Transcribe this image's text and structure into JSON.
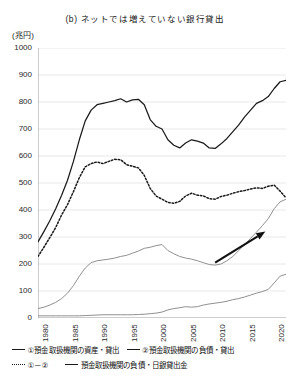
{
  "chart": {
    "title": "(b) ネットでは増えていない銀行貸出",
    "y_unit": "(兆円)"
  },
  "chart_data": {
    "type": "line",
    "title": "(b) ネットでは増えていない銀行貸出",
    "xlabel": "",
    "ylabel": "(兆円)",
    "xlim": [
      1980,
      2022
    ],
    "ylim": [
      0,
      1000
    ],
    "ytick_values": [
      0,
      100,
      200,
      300,
      400,
      500,
      600,
      700,
      800,
      900,
      1000
    ],
    "ytick_labels": [
      "0",
      "100",
      "200",
      "300",
      "400",
      "500",
      "600",
      "700",
      "800",
      "900",
      "1000"
    ],
    "xtick_values": [
      1980,
      1985,
      1990,
      1995,
      2000,
      2005,
      2010,
      2015,
      2020
    ],
    "xtick_labels": [
      "1980",
      "1985",
      "1990",
      "1995",
      "2000",
      "2005",
      "2010",
      "2015",
      "2020"
    ],
    "grid": "horizontal",
    "legend_position": "below",
    "x": [
      1980,
      1981,
      1982,
      1983,
      1984,
      1985,
      1986,
      1987,
      1988,
      1989,
      1990,
      1991,
      1992,
      1993,
      1994,
      1995,
      1996,
      1997,
      1998,
      1999,
      2000,
      2001,
      2002,
      2003,
      2004,
      2005,
      2006,
      2007,
      2008,
      2009,
      2010,
      2011,
      2012,
      2013,
      2014,
      2015,
      2016,
      2017,
      2018,
      2019,
      2020,
      2021,
      2022
    ],
    "series": [
      {
        "name": "①預金取扱機関の資産・貸出",
        "style": "solid",
        "color": "#1a1a1a",
        "values": [
          282,
          320,
          360,
          405,
          455,
          510,
          580,
          660,
          730,
          770,
          790,
          795,
          800,
          805,
          812,
          800,
          808,
          810,
          790,
          735,
          710,
          700,
          660,
          640,
          630,
          648,
          660,
          655,
          648,
          630,
          628,
          645,
          665,
          690,
          715,
          745,
          770,
          795,
          805,
          820,
          850,
          875,
          880
        ]
      },
      {
        "name": "②預金取扱機関の負債・貸出",
        "style": "solid-grey",
        "color": "#8a8a8a",
        "values": [
          35,
          40,
          48,
          58,
          72,
          92,
          120,
          155,
          185,
          205,
          212,
          215,
          218,
          222,
          228,
          232,
          240,
          248,
          258,
          262,
          268,
          272,
          250,
          238,
          228,
          222,
          218,
          212,
          205,
          198,
          196,
          200,
          212,
          228,
          250,
          272,
          295,
          318,
          342,
          368,
          405,
          430,
          440
        ]
      },
      {
        "name": "①－②",
        "style": "dotted",
        "color": "#1a1a1a",
        "values": [
          228,
          262,
          298,
          335,
          382,
          420,
          468,
          520,
          560,
          572,
          578,
          572,
          580,
          588,
          586,
          568,
          562,
          556,
          528,
          480,
          452,
          440,
          428,
          425,
          432,
          452,
          462,
          455,
          452,
          442,
          440,
          450,
          455,
          462,
          468,
          472,
          478,
          482,
          480,
          488,
          492,
          470,
          445
        ]
      },
      {
        "name": "預金取扱機関の負債・日銀貸出金",
        "style": "solid-grey2",
        "color": "#8a8a8a",
        "values": [
          8,
          8,
          8,
          8,
          8,
          8,
          8,
          8,
          9,
          10,
          11,
          12,
          12,
          12,
          12,
          12,
          12,
          13,
          14,
          16,
          18,
          22,
          30,
          35,
          38,
          42,
          40,
          42,
          48,
          52,
          55,
          58,
          62,
          68,
          72,
          78,
          85,
          92,
          98,
          106,
          130,
          155,
          162
        ]
      }
    ],
    "annotations": [
      {
        "type": "arrow",
        "from": [
          2010.0,
          205
        ],
        "to": [
          2018.5,
          320
        ]
      }
    ],
    "legend": [
      {
        "label": "①預金取扱機関の資産・貸出",
        "style": "solid"
      },
      {
        "label": "②預金取扱機関の負債・貸出",
        "style": "solid"
      },
      {
        "label": "①－②",
        "style": "dotted"
      },
      {
        "label": "預金取扱機関の負債・日銀貸出金",
        "style": "solid"
      }
    ]
  }
}
